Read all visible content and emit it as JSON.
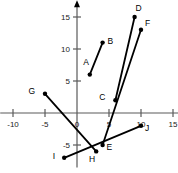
{
  "chart_data": {
    "type": "scatter",
    "title": "",
    "xlabel": "",
    "ylabel": "",
    "xlim": [
      -12,
      16
    ],
    "ylim": [
      -8.5,
      17
    ],
    "grid": false,
    "legend": "none",
    "x_ticks": [
      -10,
      -5,
      0,
      5,
      10,
      15
    ],
    "x_tick_labels": [
      "-10",
      "-5",
      "0",
      "5",
      "10",
      "15"
    ],
    "y_ticks": [
      15,
      10,
      5,
      -5
    ],
    "y_tick_labels": [
      "15",
      "10",
      "5",
      "-5"
    ],
    "origin_label": "0",
    "points": [
      {
        "name": "A",
        "x": 2,
        "y": 6,
        "label_dx": -1,
        "label_dy": -10
      },
      {
        "name": "B",
        "x": 4,
        "y": 11,
        "label_dx": 5,
        "label_dy": 1
      },
      {
        "name": "C",
        "x": 6,
        "y": 2,
        "label_dx": -10,
        "label_dy": 0
      },
      {
        "name": "D",
        "x": 9,
        "y": 15,
        "label_dx": 1,
        "label_dy": -6
      },
      {
        "name": "E",
        "x": 4,
        "y": -5,
        "label_dx": 4,
        "label_dy": 5
      },
      {
        "name": "F",
        "x": 10,
        "y": 13,
        "label_dx": 4,
        "label_dy": -4
      },
      {
        "name": "G",
        "x": -5,
        "y": 3,
        "label_dx": -10,
        "label_dy": 0
      },
      {
        "name": "H",
        "x": 3,
        "y": -6,
        "label_dx": -1,
        "label_dy": 11
      },
      {
        "name": "I",
        "x": -2,
        "y": -7,
        "label_dx": -9,
        "label_dy": 1
      },
      {
        "name": "J",
        "x": 10,
        "y": -2,
        "label_dx": 4,
        "label_dy": 5
      }
    ],
    "segments": [
      {
        "name": "segment-AB",
        "from": "A",
        "to": "B"
      },
      {
        "name": "segment-CD",
        "from": "C",
        "to": "D"
      },
      {
        "name": "segment-EF",
        "from": "E",
        "to": "F"
      },
      {
        "name": "segment-GH",
        "from": "G",
        "to": "H"
      },
      {
        "name": "segment-IJ",
        "from": "I",
        "to": "J"
      }
    ],
    "colors": {
      "axis": "#5a5a5a",
      "segment": "#000000",
      "point": "#000000",
      "background": "#ffffff"
    }
  }
}
